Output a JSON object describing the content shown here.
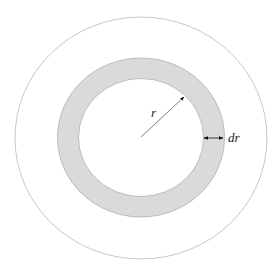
{
  "diagram": {
    "labels": {
      "radius": "r",
      "thickness": "dr"
    },
    "colors": {
      "background": "#ffffff",
      "outer_circle_stroke": "#b8b8b8",
      "ring_fill": "#dadada",
      "ring_stroke": "#9a9a9a",
      "arrow": "#111111",
      "radius_line": "#444444"
    }
  }
}
